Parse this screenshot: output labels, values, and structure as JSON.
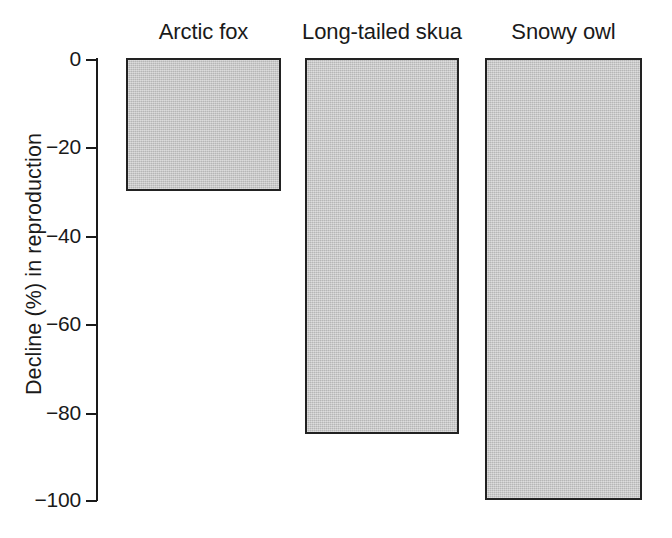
{
  "chart_data": {
    "type": "bar",
    "title": "",
    "subtitle": "",
    "xlabel": "",
    "ylabel": "Decline (%) in reproduction",
    "categories": [
      "Arctic fox",
      "Long-tailed skua",
      "Snowy owl"
    ],
    "values": [
      -30,
      -85,
      -100
    ],
    "series": [
      {
        "name": "Decline in reproduction",
        "values": [
          -30,
          -85,
          -100
        ]
      }
    ],
    "ylim": [
      -100,
      0
    ],
    "yticks": [
      0,
      -20,
      -40,
      -60,
      -80,
      -100
    ],
    "ytick_labels": [
      "0",
      "−20",
      "−40",
      "−60",
      "−80",
      "−100"
    ],
    "grid": false,
    "legend": "none",
    "bar_fill_color": "#c9c9c9",
    "bar_edge_color": "#222222",
    "axis_color": "#1a1a1a",
    "background_color": "#ffffff",
    "category_labels_position": "top"
  },
  "axis": {
    "y": {
      "label": "Decline (%) in reproduction",
      "ticks": [
        {
          "label": "0",
          "value": 0
        },
        {
          "label": "−20",
          "value": -20
        },
        {
          "label": "−40",
          "value": -40
        },
        {
          "label": "−60",
          "value": -60
        },
        {
          "label": "−80",
          "value": -80
        },
        {
          "label": "−100",
          "value": -100
        }
      ]
    }
  },
  "bars": [
    {
      "label": "Arctic fox",
      "value": -30
    },
    {
      "label": "Long-tailed skua",
      "value": -85
    },
    {
      "label": "Snowy owl",
      "value": -100
    }
  ]
}
